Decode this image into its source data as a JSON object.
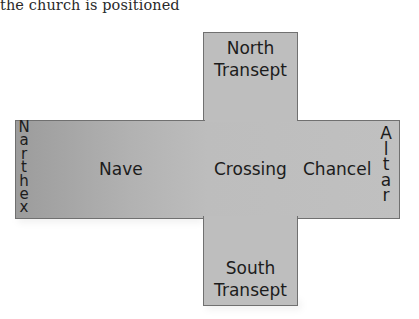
{
  "caption": "the church is positioned",
  "diagram": {
    "colors": {
      "fill_light": "#bebebe",
      "fill_dark": "#9c9c9c",
      "border": "#707070",
      "text": "#1c1c1c"
    },
    "regions": {
      "north_transept": {
        "line1": "North",
        "line2": "Transept"
      },
      "south_transept": {
        "line1": "South",
        "line2": "Transept"
      },
      "nave": "Nave",
      "crossing": "Crossing",
      "chancel": "Chancel",
      "narthex": {
        "label": "Narthex",
        "letters": [
          "N",
          "a",
          "r",
          "t",
          "h",
          "e",
          "x"
        ]
      },
      "altar": {
        "label": "Altar",
        "letters": [
          "A",
          "l",
          "t",
          "a",
          "r"
        ]
      }
    }
  }
}
